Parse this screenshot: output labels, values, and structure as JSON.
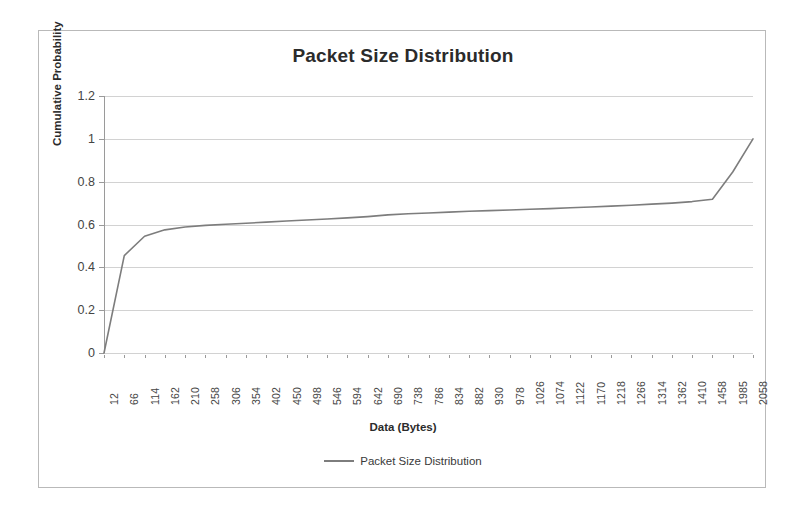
{
  "chart_data": {
    "type": "line",
    "title": "Packet Size Distribution",
    "xlabel": "Data (Bytes)",
    "ylabel": "Cumulative Probability",
    "ylim": [
      0,
      1.2
    ],
    "y_ticks": [
      "0",
      "0.2",
      "0.4",
      "0.6",
      "0.8",
      "1",
      "1.2"
    ],
    "y_tick_values": [
      0,
      0.2,
      0.4,
      0.6,
      0.8,
      1,
      1.2
    ],
    "grid": true,
    "legend_position": "bottom",
    "legend": [
      "Packet Size Distribution"
    ],
    "categories": [
      12,
      66,
      114,
      162,
      210,
      258,
      306,
      354,
      402,
      450,
      498,
      546,
      594,
      642,
      690,
      738,
      786,
      834,
      882,
      930,
      978,
      1026,
      1074,
      1122,
      1170,
      1218,
      1266,
      1314,
      1362,
      1410,
      1458,
      1985,
      2058
    ],
    "series": [
      {
        "name": "Packet Size Distribution",
        "color": "#7d7d7d",
        "values": [
          0.0,
          0.455,
          0.545,
          0.575,
          0.588,
          0.596,
          0.601,
          0.606,
          0.611,
          0.616,
          0.621,
          0.626,
          0.631,
          0.637,
          0.645,
          0.65,
          0.654,
          0.658,
          0.662,
          0.665,
          0.668,
          0.671,
          0.674,
          0.678,
          0.682,
          0.686,
          0.69,
          0.695,
          0.7,
          0.707,
          0.718,
          0.845,
          1.0
        ]
      }
    ],
    "annotations": {
      "initial_rise": "Near-vertical rise from 0 to ~0.45 between 12 and 66 bytes",
      "plateau": "Gradual climb from ~0.55 to ~0.72 across 114-1458 bytes",
      "final_jump": "Step from ~0.72 to ~0.84 at 1458, then vertical jump to 1.0 before 1985"
    }
  },
  "colors": {
    "line": "#7d7d7d",
    "grid": "#d2d2d2",
    "axis": "#9a9a9a",
    "frame": "#b9b9b9",
    "text": "#2b2b2b"
  }
}
